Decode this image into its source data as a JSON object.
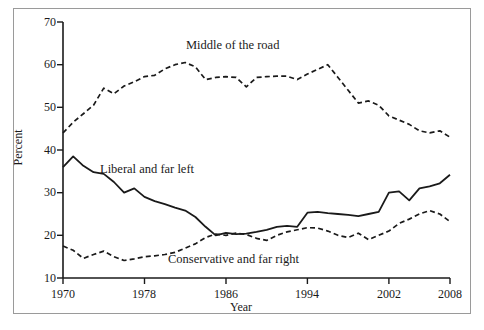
{
  "chart_data": {
    "type": "line",
    "title": "",
    "xlabel": "Year",
    "ylabel": "Percent",
    "xlim": [
      1970,
      2008
    ],
    "ylim": [
      10,
      70
    ],
    "xticks": [
      1970,
      1978,
      1986,
      1994,
      2002,
      2008
    ],
    "yticks": [
      10,
      20,
      30,
      40,
      50,
      60,
      70
    ],
    "grid": false,
    "legend_position": "inline-annotations",
    "x": [
      1970,
      1971,
      1972,
      1973,
      1974,
      1975,
      1976,
      1977,
      1978,
      1979,
      1980,
      1981,
      1982,
      1983,
      1984,
      1985,
      1986,
      1987,
      1988,
      1989,
      1990,
      1991,
      1992,
      1993,
      1994,
      1995,
      1996,
      1997,
      1998,
      1999,
      2000,
      2001,
      2002,
      2003,
      2004,
      2005,
      2006,
      2007,
      2008
    ],
    "series": [
      {
        "name": "Middle of the road",
        "style": "dashed",
        "color": "#1a1a1a",
        "values": [
          44.0,
          46.5,
          48.5,
          50.5,
          54.5,
          53.2,
          55.0,
          56.0,
          57.2,
          57.5,
          59.0,
          60.0,
          60.5,
          59.5,
          56.5,
          57.0,
          57.2,
          57.0,
          54.8,
          57.0,
          57.2,
          57.3,
          57.3,
          56.5,
          57.8,
          58.9,
          60.0,
          57.0,
          54.0,
          51.0,
          51.5,
          50.5,
          48.0,
          47.0,
          46.0,
          44.5,
          44.0,
          44.5,
          43.0
        ]
      },
      {
        "name": "Liberal and far left",
        "style": "solid",
        "color": "#1a1a1a",
        "values": [
          36.0,
          38.5,
          36.3,
          34.8,
          34.4,
          32.5,
          30.0,
          31.0,
          29.0,
          28.0,
          27.3,
          26.5,
          25.8,
          24.3,
          22.0,
          20.0,
          20.6,
          20.3,
          20.4,
          20.8,
          21.3,
          22.0,
          22.2,
          22.0,
          25.3,
          25.5,
          25.2,
          25.0,
          24.8,
          24.5,
          25.0,
          25.5,
          30.0,
          30.3,
          28.2,
          31.0,
          31.5,
          32.2,
          34.2
        ]
      },
      {
        "name": "Conservative and far right",
        "style": "dashed",
        "color": "#1a1a1a",
        "values": [
          17.5,
          16.5,
          14.6,
          15.5,
          16.3,
          15.0,
          14.1,
          14.5,
          15.0,
          15.2,
          15.5,
          16.0,
          17.0,
          18.0,
          19.5,
          20.3,
          20.0,
          20.5,
          20.2,
          19.3,
          18.8,
          20.0,
          20.8,
          21.3,
          21.8,
          21.7,
          21.0,
          20.0,
          19.5,
          20.5,
          19.0,
          20.0,
          21.0,
          22.8,
          23.8,
          25.0,
          25.8,
          25.0,
          23.2
        ]
      }
    ]
  },
  "axes": {
    "ylabel": "Percent",
    "xlabel": "Year",
    "ytick_labels": [
      "70",
      "60",
      "50",
      "40",
      "30",
      "20",
      "10"
    ],
    "xtick_labels": [
      "1970",
      "1978",
      "1986",
      "1994",
      "2002",
      "2008"
    ]
  },
  "annotations": {
    "middle": "Middle of the road",
    "liberal": "Liberal and far left",
    "conservative": "Conservative and far right"
  }
}
